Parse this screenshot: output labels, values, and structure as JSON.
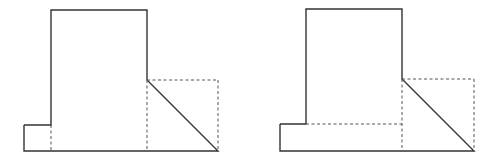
{
  "diagram": {
    "type": "orthographic-views",
    "background": "#ffffff",
    "colors": {
      "solid_line": "#333333",
      "dashed_line": "#555555"
    },
    "figures": [
      {
        "id": "figure-left",
        "description": "Tall block with small base step on left and triangular chamfer on right",
        "outline": [
          [
            24,
            125
          ],
          [
            51,
            125
          ],
          [
            51,
            10
          ],
          [
            147,
            10
          ],
          [
            147,
            80
          ],
          [
            218,
            151
          ],
          [
            24,
            151
          ]
        ],
        "hidden_lines": [
          [
            [
              51,
              125
            ],
            [
              51,
              151
            ]
          ],
          [
            [
              147,
              80
            ],
            [
              218,
              80
            ]
          ],
          [
            [
              218,
              80
            ],
            [
              218,
              151
            ]
          ],
          [
            [
              147,
              80
            ],
            [
              147,
              151
            ]
          ]
        ]
      },
      {
        "id": "figure-right",
        "description": "Tall block on wide base slab with triangular chamfer on right",
        "outline": [
          [
            280,
            124
          ],
          [
            306,
            124
          ],
          [
            306,
            9
          ],
          [
            402,
            9
          ],
          [
            402,
            79
          ],
          [
            474,
            151
          ],
          [
            280,
            151
          ]
        ],
        "hidden_lines": [
          [
            [
              306,
              124
            ],
            [
              402,
              124
            ]
          ],
          [
            [
              402,
              79
            ],
            [
              474,
              79
            ]
          ],
          [
            [
              474,
              79
            ],
            [
              474,
              151
            ]
          ],
          [
            [
              402,
              79
            ],
            [
              402,
              151
            ]
          ]
        ]
      }
    ]
  }
}
